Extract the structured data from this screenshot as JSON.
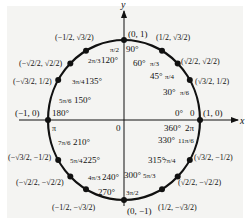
{
  "diagram": {
    "axes": {
      "x_label": "x",
      "y_label": "y",
      "origin_label": "0"
    },
    "colors": {
      "ink": "#111111",
      "panel": "#f4f4f2",
      "background": "#ffffff"
    },
    "geometry": {
      "cx": 124,
      "cy": 120,
      "rx": 76,
      "ry": 80
    },
    "points": [
      {
        "deg": "0°",
        "rad": "0",
        "coord": "(1, 0)",
        "angle": 0
      },
      {
        "deg": "30°",
        "rad": "π/6",
        "coord": "(√3/2, 1/2)",
        "angle": 30
      },
      {
        "deg": "45°",
        "rad": "π/4",
        "coord": "(√2/2, √2/2)",
        "angle": 45
      },
      {
        "deg": "60°",
        "rad": "π/3",
        "coord": "(1/2, √3/2)",
        "angle": 60
      },
      {
        "deg": "90°",
        "rad": "π/2",
        "coord": "(0, 1)",
        "angle": 90
      },
      {
        "deg": "120°",
        "rad": "2π/3",
        "coord": "(−1/2, √3/2)",
        "angle": 120
      },
      {
        "deg": "135°",
        "rad": "3π/4",
        "coord": "(−√2/2, √2/2)",
        "angle": 135
      },
      {
        "deg": "150°",
        "rad": "5π/6",
        "coord": "(−√3/2, 1/2)",
        "angle": 150
      },
      {
        "deg": "180°",
        "rad": "π",
        "coord": "(−1, 0)",
        "angle": 180
      },
      {
        "deg": "210°",
        "rad": "7π/6",
        "coord": "(−√3/2, −1/2)",
        "angle": 210
      },
      {
        "deg": "225°",
        "rad": "5π/4",
        "coord": "(−√2/2, −√2/2)",
        "angle": 225
      },
      {
        "deg": "240°",
        "rad": "4π/3",
        "coord": "(−1/2, −√3/2)",
        "angle": 240
      },
      {
        "deg": "270°",
        "rad": "3π/2",
        "coord": "(0, −1)",
        "angle": 270
      },
      {
        "deg": "300°",
        "rad": "5π/3",
        "coord": "(1/2, −√3/2)",
        "angle": 300
      },
      {
        "deg": "315°",
        "rad": "7π/4",
        "coord": "(√2/2, −√2/2)",
        "angle": 315
      },
      {
        "deg": "330°",
        "rad": "11π/6",
        "coord": "(√3/2, −1/2)",
        "angle": 330
      },
      {
        "deg": "360°",
        "rad": "2π",
        "coord": "",
        "angle": 360
      }
    ]
  }
}
